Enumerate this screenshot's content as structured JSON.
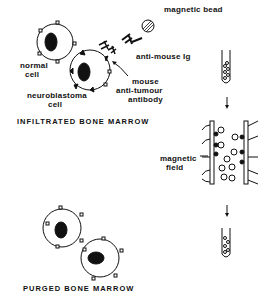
{
  "labels": {
    "magnetic_bead": "magnetic bead",
    "anti_mouse_ig": "anti-mouse Ig",
    "normal_cell_1": "normal",
    "normal_cell_2": "cell",
    "neuroblastoma_1": "neuroblastoma",
    "neuroblastoma_2": "cell",
    "mouse_antibody_1": "mouse",
    "mouse_antibody_2": "anti-tumour",
    "mouse_antibody_3": "antibody",
    "magnetic_field_1": "magnetic",
    "magnetic_field_2": "field"
  },
  "titles": {
    "infiltrated": "INFILTRATED  BONE  MARROW",
    "purged": "PURGED  BONE  MARROW"
  },
  "colors": {
    "ink": "#111111",
    "background": "#ffffff"
  }
}
